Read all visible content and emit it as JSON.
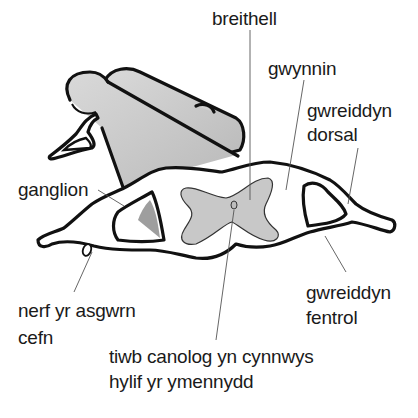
{
  "diagram": {
    "language": "Welsh",
    "labels": {
      "breithell": "breithell",
      "gwynnin": "gwynnin",
      "gwreiddyn_dorsal_1": "gwreiddyn",
      "gwreiddyn_dorsal_2": "dorsal",
      "ganglion": "ganglion",
      "nerf_1": "nerf yr asgwrn",
      "nerf_2": "cefn",
      "gwreiddyn_fentrol_1": "gwreiddyn",
      "gwreiddyn_fentrol_2": "fentrol",
      "tiwb_1": "tiwb canolog yn cynnwys",
      "tiwb_2": "hylif yr ymennydd"
    },
    "colors": {
      "background": "#ffffff",
      "grey_matter": "#c8c8c8",
      "cord_body": "#cfcfcf",
      "outline": "#111111",
      "leader_line": "#555555",
      "text": "#1a1a1a"
    }
  }
}
